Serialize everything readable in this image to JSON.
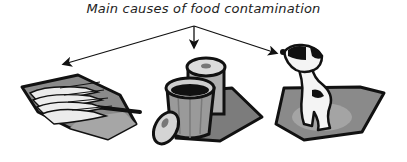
{
  "diagram": {
    "title": "Main causes of food contamination",
    "causes": [
      {
        "id": "fish",
        "icon": "fish-on-tray-icon",
        "label": ""
      },
      {
        "id": "trash",
        "icon": "trash-can-icon",
        "label": ""
      },
      {
        "id": "dog",
        "icon": "dog-icon",
        "label": ""
      }
    ],
    "colors": {
      "outline": "#111111",
      "mat_dark": "#7a7a7a",
      "mat_light": "#a8a8a8",
      "can": "#9a9a9a",
      "can_light": "#d6d6d6",
      "fish": "#e8e8e8",
      "background": "#ffffff"
    }
  }
}
